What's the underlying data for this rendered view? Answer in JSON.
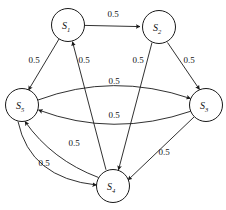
{
  "diagram": {
    "type": "state-transition-graph",
    "title": "",
    "stroke_color": "#1a1a1a",
    "node_fill": "#ffffff",
    "node_radius": 16.5,
    "nodes": [
      {
        "id": "S1",
        "label": "S",
        "subscript": "1",
        "cx": 68,
        "cy": 25
      },
      {
        "id": "S2",
        "label": "S",
        "subscript": "2",
        "cx": 159,
        "cy": 27
      },
      {
        "id": "S3",
        "label": "S",
        "subscript": "3",
        "cx": 206,
        "cy": 105
      },
      {
        "id": "S4",
        "label": "S",
        "subscript": "4",
        "cx": 113,
        "cy": 186
      },
      {
        "id": "S5",
        "label": "S",
        "subscript": "5",
        "cx": 22,
        "cy": 105
      }
    ],
    "edges": [
      {
        "id": "e1",
        "from": "S1",
        "to": "S2",
        "weight": "0.5",
        "label_x": 113,
        "label_y": 17
      },
      {
        "id": "e2",
        "from": "S1",
        "to": "S5",
        "weight": "0.5",
        "label_x": 34,
        "label_y": 63
      },
      {
        "id": "e3",
        "from": "S4",
        "to": "S1",
        "weight": "0.5",
        "label_x": 84,
        "label_y": 63
      },
      {
        "id": "e4",
        "from": "S2",
        "to": "S4",
        "weight": "0.5",
        "label_x": 138,
        "label_y": 63
      },
      {
        "id": "e5",
        "from": "S2",
        "to": "S3",
        "weight": "0.5",
        "label_x": 189,
        "label_y": 63
      },
      {
        "id": "e6",
        "from": "S5",
        "to": "S3",
        "weight": "0.5",
        "label_x": 114,
        "label_y": 84
      },
      {
        "id": "e7",
        "from": "S3",
        "to": "S5",
        "weight": "0.5",
        "label_x": 114,
        "label_y": 118
      },
      {
        "id": "e8",
        "from": "S4",
        "to": "S5",
        "weight": "0.5",
        "label_x": 74,
        "label_y": 146
      },
      {
        "id": "e9",
        "from": "S5",
        "to": "S4",
        "weight": "0.5",
        "label_x": 44,
        "label_y": 166
      },
      {
        "id": "e10",
        "from": "S3",
        "to": "S4",
        "weight": "0.5",
        "label_x": 164,
        "label_y": 155
      }
    ]
  }
}
